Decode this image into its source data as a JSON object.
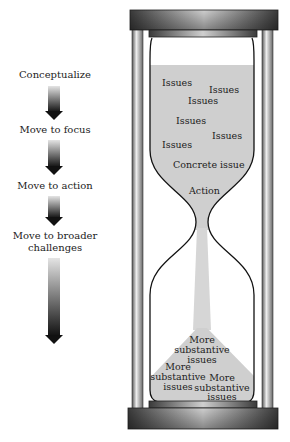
{
  "stages": [
    {
      "label": "Conceptualize"
    },
    {
      "label": "Move to focus"
    },
    {
      "label": "Move to action"
    },
    {
      "label": "Move to broader challenges",
      "line1": "Move to broader",
      "line2": "challenges"
    }
  ],
  "hourglass": {
    "top_chamber": {
      "issues": [
        "Issues",
        "Issues",
        "Issues",
        "Issues",
        "Issues",
        "Issues"
      ],
      "concrete": "Concrete issue",
      "action": "Action"
    },
    "bottom_chamber": {
      "pile": [
        {
          "l1": "More",
          "l2": "substantive",
          "l3": "issues"
        },
        {
          "l1": "More",
          "l2": "substantive",
          "l3": "issues"
        },
        {
          "l1": "More",
          "l2": "substantive",
          "l3": "issues"
        }
      ]
    }
  },
  "colors": {
    "sand": "#cfcfcf",
    "frame": "#5a5a5a",
    "outline": "#111111"
  }
}
